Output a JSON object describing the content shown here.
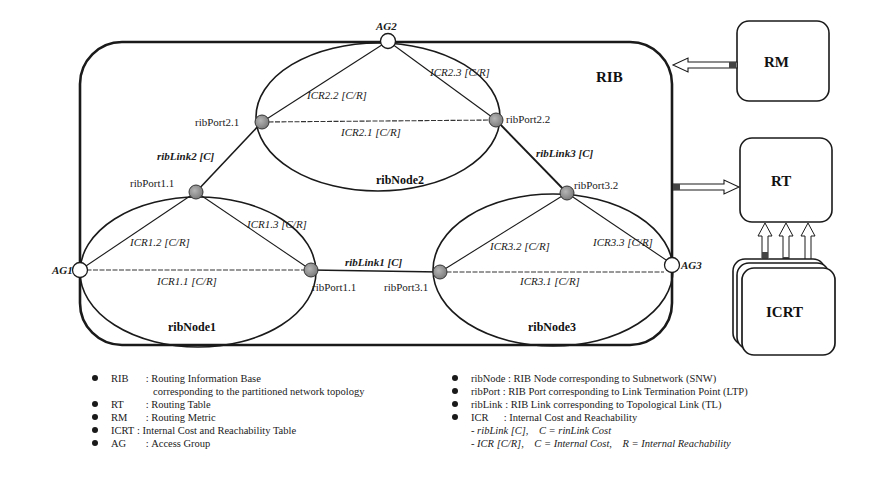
{
  "diagram": {
    "rib_label": "RIB",
    "nodes": [
      {
        "id": "ribNode1",
        "label": "ribNode1"
      },
      {
        "id": "ribNode2",
        "label": "ribNode2"
      },
      {
        "id": "ribNode3",
        "label": "ribNode3"
      }
    ],
    "ports": {
      "p21": "ribPort2.1",
      "p22": "ribPort2.2",
      "p11_top": "ribPort1.1",
      "p11_right": "ribPort1.1",
      "p31": "ribPort3.1",
      "p32": "ribPort3.2"
    },
    "access_groups": {
      "ag1": "AG1",
      "ag2": "AG2",
      "ag3": "AG3"
    },
    "links": {
      "link1": "ribLink1 [C]",
      "link2": "ribLink2 [C]",
      "link3": "ribLink3 [C]"
    },
    "icr": {
      "icr11": "ICR1.1 [C/R]",
      "icr12": "ICR1.2 [C/R]",
      "icr13": "ICR1.3 [C/R]",
      "icr21": "ICR2.1 [C/R]",
      "icr22": "ICR2.2 [C/R]",
      "icr23": "ICR2.3 [C/R]",
      "icr31": "ICR3.1 [C/R]",
      "icr32": "ICR3.2 [C/R]",
      "icr33": "ICR3.3 [C/R]"
    },
    "boxes": {
      "rm": "RM",
      "rt": "RT",
      "icrt": "ICRT"
    },
    "colors": {
      "line": "#1a1a1a",
      "port_fill": "#9a9a9a",
      "ag_fill": "#ffffff"
    }
  },
  "legend": {
    "left": [
      {
        "key": "RIB",
        "sep": " : ",
        "text": "Routing Information Base",
        "cont": "corresponding to the partitioned network topology"
      },
      {
        "key": "RT",
        "sep": " : ",
        "text": "Routing Table"
      },
      {
        "key": "RM",
        "sep": " : ",
        "text": "Routing Metric"
      },
      {
        "key": "ICRT",
        "sep": " : ",
        "text": "Internal Cost and Reachability Table"
      },
      {
        "key": "AG",
        "sep": " : ",
        "text": "Access Group"
      }
    ],
    "right": [
      {
        "key": "ribNode",
        "sep": " : ",
        "text": "RIB Node corresponding to Subnetwork (SNW)"
      },
      {
        "key": "ribPort",
        "sep": " : ",
        "text": "RIB Port corresponding to Link Termination Point (LTP)"
      },
      {
        "key": "ribLink",
        "sep": " : ",
        "text": "RIB Link corresponding to Topological Link (TL)"
      },
      {
        "key": "ICR",
        "sep": " : ",
        "text": "Internal Cost and Reachability"
      }
    ],
    "right_notes": [
      "- ribLink [C],    C = rinLink Cost",
      "- ICR [C/R],    C = Internal Cost,    R = Internal Reachability"
    ]
  }
}
